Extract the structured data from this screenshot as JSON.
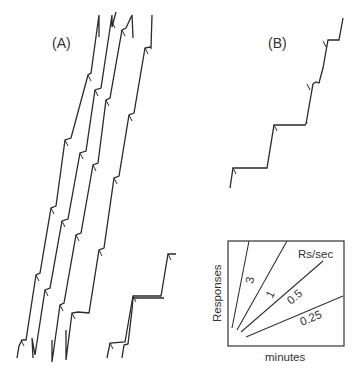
{
  "panels": [
    {
      "label": "(A)",
      "description": "Fixed-interval cumulative records (multiple)"
    },
    {
      "label": "(B)",
      "description": "Fixed-interval cumulative record with pauses"
    }
  ],
  "inset": {
    "y_label": "Responses",
    "x_label": "minutes",
    "legend_title": "Rs/sec",
    "rates": [
      "3",
      "1",
      "0.5",
      "0.25"
    ]
  }
}
